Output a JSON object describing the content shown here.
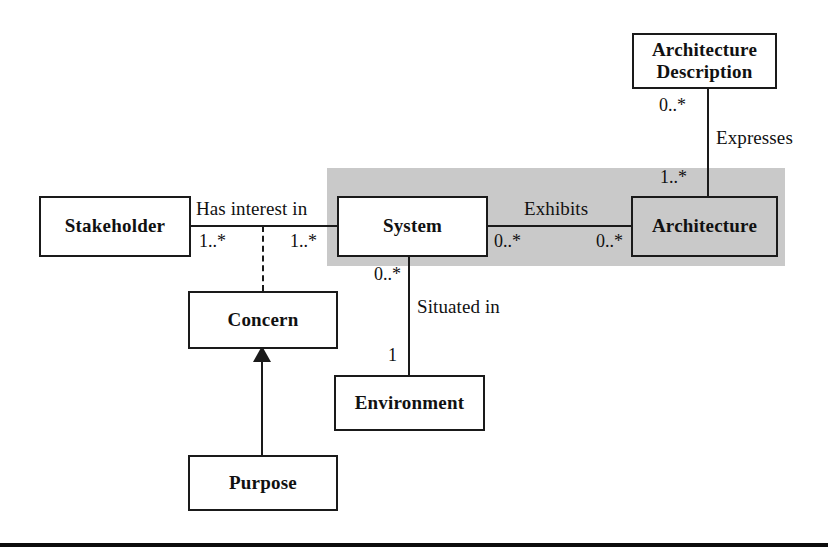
{
  "diagram": {
    "type": "uml-class-diagram",
    "title": "",
    "nodes": [
      {
        "id": "architecture_description",
        "label": "Architecture\nDescription",
        "shaded": false
      },
      {
        "id": "stakeholder",
        "label": "Stakeholder",
        "shaded": false
      },
      {
        "id": "system",
        "label": "System",
        "shaded": false
      },
      {
        "id": "architecture",
        "label": "Architecture",
        "shaded": true
      },
      {
        "id": "concern",
        "label": "Concern",
        "shaded": false
      },
      {
        "id": "environment",
        "label": "Environment",
        "shaded": false
      },
      {
        "id": "purpose",
        "label": "Purpose",
        "shaded": false
      }
    ],
    "relationships": [
      {
        "id": "expresses",
        "label": "Expresses",
        "from": "architecture_description",
        "to": "architecture",
        "from_multiplicity": "0..*",
        "to_multiplicity": "1..*"
      },
      {
        "id": "has_interest_in",
        "label": "Has interest in",
        "from": "stakeholder",
        "to": "system",
        "from_multiplicity": "1..*",
        "to_multiplicity": "1..*"
      },
      {
        "id": "exhibits",
        "label": "Exhibits",
        "from": "system",
        "to": "architecture",
        "from_multiplicity": "0..*",
        "to_multiplicity": "0..*"
      },
      {
        "id": "situated_in",
        "label": "Situated in",
        "from": "system",
        "to": "environment",
        "from_multiplicity": "0..*",
        "to_multiplicity": "1"
      },
      {
        "id": "purpose_to_concern",
        "label": "",
        "from": "purpose",
        "to": "concern",
        "from_multiplicity": "",
        "to_multiplicity": ""
      }
    ],
    "highlight_band": {
      "label": "shaded-highlight-region",
      "color": "#c9c9c9"
    },
    "colors": {
      "line": "#1a1a1a",
      "node_fill": "#ffffff",
      "shaded_fill": "#c9c9c9",
      "text": "#111111",
      "rule": "#0c0c0c"
    }
  }
}
